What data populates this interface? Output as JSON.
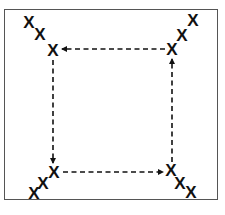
{
  "diagram": {
    "type": "cycle",
    "colors": {
      "frame": "#555555",
      "ink": "#111111",
      "background": "#ffffff"
    },
    "marker_glyph": "X",
    "clusters": [
      {
        "name": "top-left",
        "marks": [
          {
            "x": 29,
            "y": 22
          },
          {
            "x": 40,
            "y": 34
          },
          {
            "x": 53,
            "y": 50
          }
        ]
      },
      {
        "name": "top-right",
        "marks": [
          {
            "x": 193,
            "y": 20
          },
          {
            "x": 182,
            "y": 35
          },
          {
            "x": 172,
            "y": 49
          }
        ]
      },
      {
        "name": "bottom-left",
        "marks": [
          {
            "x": 54,
            "y": 172
          },
          {
            "x": 43,
            "y": 183
          },
          {
            "x": 34,
            "y": 193
          }
        ]
      },
      {
        "name": "bottom-right",
        "marks": [
          {
            "x": 171,
            "y": 170
          },
          {
            "x": 180,
            "y": 183
          },
          {
            "x": 191,
            "y": 192
          }
        ]
      }
    ],
    "arrows": [
      {
        "name": "top-right-to-top-left",
        "from": [
          165,
          49
        ],
        "to": [
          62,
          49
        ],
        "style": "dashed"
      },
      {
        "name": "top-left-to-bottom-left",
        "from": [
          53,
          60
        ],
        "to": [
          53,
          163
        ],
        "style": "dashed"
      },
      {
        "name": "bottom-left-to-bottom-right",
        "from": [
          63,
          172
        ],
        "to": [
          163,
          172
        ],
        "style": "dashed"
      },
      {
        "name": "bottom-right-to-top-right",
        "from": [
          172,
          162
        ],
        "to": [
          172,
          59
        ],
        "style": "dashed"
      }
    ]
  }
}
